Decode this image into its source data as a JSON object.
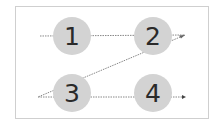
{
  "diagram": {
    "type": "z-pattern reading flow",
    "frame_color": "#cfcfcf",
    "node_fill": "#d3d3d3",
    "line_color": "#888888",
    "nodes": [
      {
        "label": "1",
        "cx": 72,
        "cy": 36
      },
      {
        "label": "2",
        "cx": 153,
        "cy": 36
      },
      {
        "label": "3",
        "cx": 72,
        "cy": 93
      },
      {
        "label": "4",
        "cx": 153,
        "cy": 93
      }
    ],
    "path": [
      {
        "from": "start",
        "to": "1"
      },
      {
        "from": "1",
        "to": "2"
      },
      {
        "from": "2",
        "to": "3",
        "style": "diagonal"
      },
      {
        "from": "3",
        "to": "4"
      },
      {
        "from": "4",
        "to": "end",
        "arrow": true
      }
    ]
  }
}
